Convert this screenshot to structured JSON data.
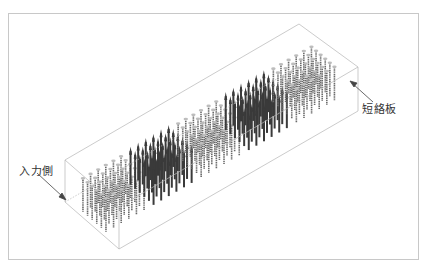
{
  "diagram": {
    "type": "3d-isometric-array-diagram",
    "labels": {
      "input_side": "入力側",
      "short_plate": "短絡板"
    },
    "blocks": [
      {
        "index": 1,
        "style": "light-topped"
      },
      {
        "index": 2,
        "style": "dark"
      },
      {
        "index": 3,
        "style": "light-topped"
      },
      {
        "index": 4,
        "style": "dark"
      },
      {
        "index": 5,
        "style": "light-topped"
      }
    ],
    "colors": {
      "frame": "#c8c8c8",
      "box_edge": "#b0b0b0",
      "rod_dark": "#3a3a3a",
      "rod_mid": "#6a6a6a",
      "rod_top_light": "#bdbdbd",
      "arrow": "#444444",
      "text": "#333333"
    }
  }
}
